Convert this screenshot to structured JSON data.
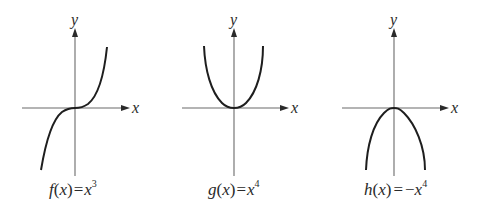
{
  "figure": {
    "panels": [
      {
        "id": "f",
        "func_name": "f",
        "var": "x",
        "eq": "=",
        "neg": "",
        "base": "x",
        "exponent": "3",
        "caption": "f(x) = x^3",
        "x_axis_label": "x",
        "y_axis_label": "y",
        "shape": "cubic"
      },
      {
        "id": "g",
        "func_name": "g",
        "var": "x",
        "eq": "=",
        "neg": "",
        "base": "x",
        "exponent": "4",
        "caption": "g(x) = x^4",
        "x_axis_label": "x",
        "y_axis_label": "y",
        "shape": "quartic-up"
      },
      {
        "id": "h",
        "func_name": "h",
        "var": "x",
        "eq": "=",
        "neg": "−",
        "base": "x",
        "exponent": "4",
        "caption": "h(x) = −x^4",
        "x_axis_label": "x",
        "y_axis_label": "y",
        "shape": "quartic-down"
      }
    ]
  },
  "colors": {
    "axis": "#6b6b6b",
    "curve": "#1e1e1e",
    "text": "#2a2a2a",
    "background": "#ffffff"
  }
}
